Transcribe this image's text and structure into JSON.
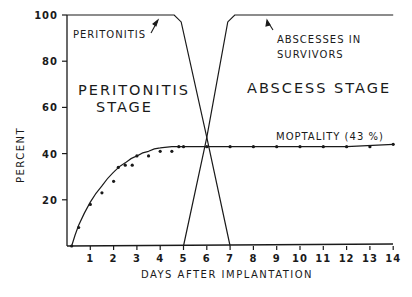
{
  "chart_data": {
    "type": "line",
    "title": "",
    "xlabel": "DAYS AFTER IMPLANTATION",
    "ylabel": "PERCENT",
    "xlim": [
      0,
      14
    ],
    "ylim": [
      0,
      100
    ],
    "x_ticks": [
      1,
      2,
      3,
      4,
      5,
      6,
      7,
      8,
      9,
      10,
      11,
      12,
      13,
      14
    ],
    "y_ticks": [
      20,
      40,
      60,
      80,
      100
    ],
    "grid": false,
    "legend": "none (inline annotations)",
    "series": [
      {
        "name": "Peritonitis",
        "kind": "line",
        "x": [
          0,
          4.6,
          4.9,
          6,
          7
        ],
        "values": [
          100,
          100,
          97,
          47,
          0
        ]
      },
      {
        "name": "Abscesses in survivors",
        "kind": "line",
        "x": [
          5,
          6,
          6.9,
          7.2,
          14
        ],
        "values": [
          0,
          47,
          97,
          100,
          100
        ]
      },
      {
        "name": "Mortality (43%) fitted curve",
        "kind": "line",
        "x": [
          0.2,
          0.5,
          1,
          1.5,
          2,
          2.5,
          3,
          3.5,
          4,
          4.5,
          5,
          6,
          8,
          10,
          12,
          14
        ],
        "values": [
          0,
          9,
          19,
          26,
          32,
          36,
          39,
          41,
          42.5,
          43,
          43,
          43,
          43,
          43,
          43,
          44
        ]
      },
      {
        "name": "Mortality observed",
        "kind": "scatter",
        "x": [
          0.2,
          0.5,
          1,
          1.5,
          2,
          2.2,
          2.5,
          2.8,
          3,
          3.5,
          4,
          4.5,
          4.8,
          5,
          6,
          7,
          8,
          9,
          10,
          11,
          12,
          13,
          14
        ],
        "values": [
          0,
          8,
          18,
          23,
          28,
          34,
          35,
          35,
          39,
          39,
          41,
          41,
          43,
          43,
          43,
          43,
          43,
          43,
          43,
          43,
          43,
          43,
          44
        ]
      }
    ],
    "annotations": [
      {
        "text": "PERITONITIS",
        "points_to": "peritonitis plateau"
      },
      {
        "text": "ABSCESSES IN SURVIVORS",
        "points_to": "abscess plateau"
      },
      {
        "text": "PERITONITIS STAGE",
        "region": "days 0-6"
      },
      {
        "text": "ABSCESS STAGE",
        "region": "days 6-14"
      },
      {
        "text": "MOPTALITY (43 %)",
        "points_to": "mortality line"
      }
    ]
  },
  "labels": {
    "ylabel": "PERCENT",
    "xlabel": "DAYS AFTER IMPLANTATION",
    "peritonitis": "PERITONITIS",
    "abscess_line1": "ABSCESSES IN",
    "abscess_line2": "SURVIVORS",
    "stage_left_1": "PERITONITIS",
    "stage_left_2": "STAGE",
    "stage_right": "ABSCESS STAGE",
    "mortality": "MOPTALITY (43 %)"
  },
  "colors": {
    "ink": "#1a1a1a",
    "background": "#ffffff"
  }
}
